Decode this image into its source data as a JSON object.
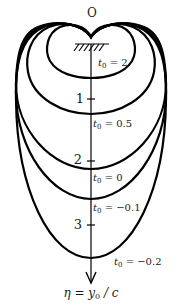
{
  "diagram": {
    "origin_label": "O",
    "axis_label": {
      "eta": "η",
      "eq": " = ",
      "y": "y",
      "sub": "0",
      "rest": " / c"
    },
    "ticks": [
      {
        "label": "1",
        "y": 99
      },
      {
        "label": "2",
        "y": 161
      },
      {
        "label": "3",
        "y": 225
      }
    ],
    "curves": [
      {
        "name": "t0 = 2",
        "t": "t",
        "sub": "0",
        "val": " = 2",
        "bottom_y": 78
      },
      {
        "name": "t0 = 0.5",
        "t": "t",
        "sub": "0",
        "val": " = 0.5",
        "bottom_y": 114
      },
      {
        "name": "t0 = 0",
        "t": "t",
        "sub": "0",
        "val": " = 0",
        "bottom_y": 169
      },
      {
        "name": "t0 = -0.1",
        "t": "t",
        "sub": "0",
        "val": " = −0.1",
        "bottom_y": 199
      },
      {
        "name": "t0 = -0.2",
        "t": "t",
        "sub": "0",
        "val": " = −0.2",
        "bottom_y": 258
      }
    ],
    "colors": {
      "stroke": "#000000",
      "background": "#ffffff"
    }
  }
}
